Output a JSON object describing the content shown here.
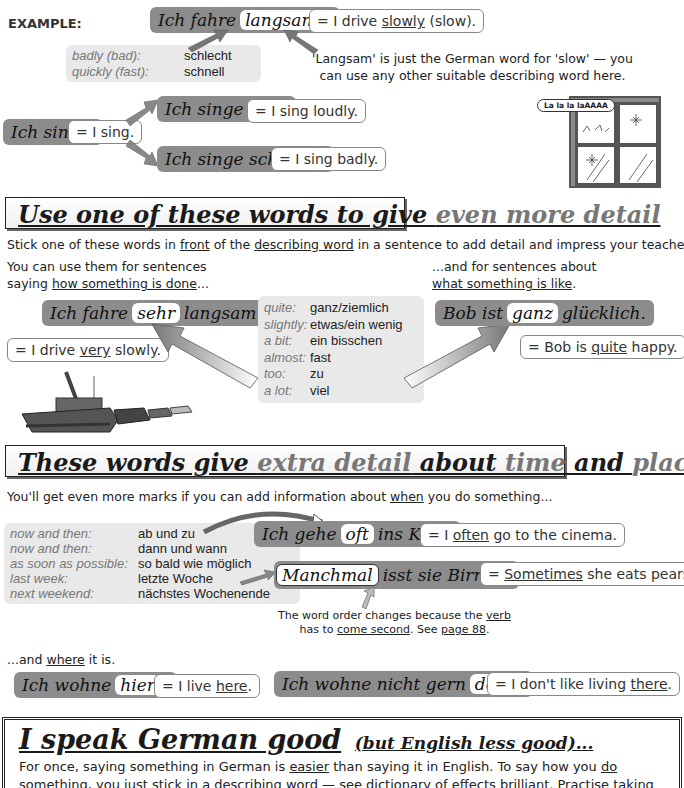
{
  "example": {
    "label": "EXAMPLE:",
    "sentence_pre": "Ich fahre",
    "sentence_highlight": "langsam",
    "sentence_post": ".",
    "translation_pre": "= I drive ",
    "translation_u": "slowly",
    "translation_post": " (slow).",
    "vocab": [
      {
        "key": "badly (bad):",
        "value": "schlecht"
      },
      {
        "key": "quickly (fast):",
        "value": "schnell"
      }
    ],
    "note_line1": "'Langsam' is just the German word for 'slow' — you",
    "note_line2": "can use any other suitable describing word here."
  },
  "singing": {
    "base": "Ich singe.",
    "base_en": "= I sing.",
    "loud": "Ich singe laut.",
    "loud_en": "= I sing loudly.",
    "bad": "Ich singe schlecht.",
    "bad_en": "= I sing badly.",
    "speech_bubble": "La la la laAAAA"
  },
  "section1": {
    "title_a": "Use one of these words to give ",
    "title_b": "even more detail",
    "intro_pre": "Stick one of these words in ",
    "intro_u1": "front",
    "intro_mid": " of the ",
    "intro_u2": "describing word",
    "intro_post": " in a sentence to add detail and impress your teacher:",
    "left_line1": "You can use them for sentences",
    "left_line2_pre": "saying ",
    "left_line2_u": "how something is done",
    "left_line2_post": "...",
    "right_line1": "...and for sentences about",
    "right_line2_u": "what something is like",
    "right_line2_post": ".",
    "left_de_pre": "Ich fahre",
    "left_de_hl": "sehr",
    "left_de_post": "langsam.",
    "left_en_pre": "= I drive ",
    "left_en_u": "very",
    "left_en_post": " slowly.",
    "right_de_pre": "Bob ist",
    "right_de_hl": "ganz",
    "right_de_post": "glücklich.",
    "right_en_pre": "= Bob is ",
    "right_en_u": "quite",
    "right_en_post": " happy.",
    "vocab": [
      {
        "key": "quite:",
        "value": "ganz/ziemlich"
      },
      {
        "key": "slightly:",
        "value": "etwas/ein wenig"
      },
      {
        "key": "a bit:",
        "value": "ein bisschen"
      },
      {
        "key": "almost:",
        "value": "fast"
      },
      {
        "key": "too:",
        "value": "zu"
      },
      {
        "key": "a lot:",
        "value": "viel"
      }
    ]
  },
  "section2": {
    "title_a": "These words give ",
    "title_b": "extra detail",
    "title_c": " about ",
    "title_d": "time",
    "title_e": " and ",
    "title_f": "place",
    "intro_pre": "You'll get even more marks if you can add information about ",
    "intro_u": "when",
    "intro_post": " you do something...",
    "vocab": [
      {
        "key": "now and then:",
        "value": "ab und zu"
      },
      {
        "key": "now and then:",
        "value": "dann und wann"
      },
      {
        "key": "as soon as possible:",
        "value": "so bald wie möglich"
      },
      {
        "key": "last week:",
        "value": "letzte Woche"
      },
      {
        "key": "next weekend:",
        "value": "nächstes Wochenende"
      }
    ],
    "kino_pre": "Ich gehe",
    "kino_hl": "oft",
    "kino_post": "ins Kino.",
    "kino_en_pre": "= I ",
    "kino_en_u": "often",
    "kino_en_post": " go to the cinema.",
    "birnen_hl": "Manchmal",
    "birnen_post": "isst sie Birnen.",
    "birnen_en_pre": "= ",
    "birnen_en_u": "Sometimes",
    "birnen_en_post": " she eats pears.",
    "note_pre": "The word order changes because the ",
    "note_u1": "verb",
    "note_line2_pre": "has to ",
    "note_u2": "come second",
    "note_mid": ".  See ",
    "note_u3": "page 88",
    "note_post": ".",
    "where_pre": "...and ",
    "where_u": "where",
    "where_post": " it is.",
    "hier_pre": "Ich wohne",
    "hier_hl": "hier",
    "hier_post": ".",
    "hier_en_pre": "= I live ",
    "hier_en_u": "here",
    "hier_en_post": ".",
    "dort_pre": "Ich wohne nicht gern",
    "dort_hl": "dort",
    "dort_post": ".",
    "dort_en_pre": "= I don't like living ",
    "dort_en_u": "there",
    "dort_en_post": "."
  },
  "section3": {
    "title_a": "I speak German good",
    "title_b": "(but English less good)...",
    "body_pre": "For once, saying something in German is ",
    "body_u1": "easier",
    "body_mid": " than saying it in English.  To say how you ",
    "body_u2": "do",
    "body_line2": "something, you just stick in a describing word — see dictionary of effects brilliant. Practise taking"
  }
}
